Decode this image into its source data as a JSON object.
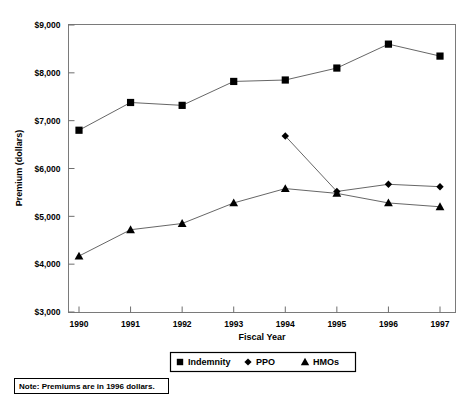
{
  "chart_data": {
    "type": "line",
    "title": "",
    "xlabel": "Fiscal Year",
    "ylabel": "Premium (dollars)",
    "categories": [
      "1990",
      "1991",
      "1992",
      "1993",
      "1994",
      "1995",
      "1996",
      "1997"
    ],
    "x": [
      1990,
      1991,
      1992,
      1993,
      1994,
      1995,
      1996,
      1997
    ],
    "xlim": [
      1990,
      1997
    ],
    "ylim": [
      3000,
      9000
    ],
    "ytick_labels": [
      "$3,000",
      "$4,000",
      "$5,000",
      "$6,000",
      "$7,000",
      "$8,000",
      "$9,000"
    ],
    "ytick_values": [
      3000,
      4000,
      5000,
      6000,
      7000,
      8000,
      9000
    ],
    "grid": false,
    "legend_position": "bottom-center",
    "series": [
      {
        "name": "Indemnity",
        "marker": "square",
        "values": [
          6800,
          7380,
          7320,
          7820,
          7850,
          8100,
          8600,
          8350
        ]
      },
      {
        "name": "PPO",
        "marker": "diamond",
        "values": [
          null,
          null,
          null,
          null,
          6680,
          5520,
          5670,
          5620
        ]
      },
      {
        "name": "HMOs",
        "marker": "triangle",
        "values": [
          4170,
          4720,
          4850,
          5280,
          5580,
          5480,
          5280,
          5200
        ]
      }
    ],
    "annotations": [
      {
        "name": "note",
        "text": "Note: Premiums are in 1996 dollars."
      }
    ]
  },
  "legend": {
    "items": [
      {
        "label": "Indemnity",
        "marker": "square"
      },
      {
        "label": "PPO",
        "marker": "diamond"
      },
      {
        "label": "HMOs",
        "marker": "triangle"
      }
    ]
  },
  "note": {
    "text": "Note: Premiums are in 1996 dollars."
  },
  "colors": {
    "marker": "#000000",
    "line": "#555555",
    "frame": "#7a7a7a",
    "background": "#ffffff"
  }
}
